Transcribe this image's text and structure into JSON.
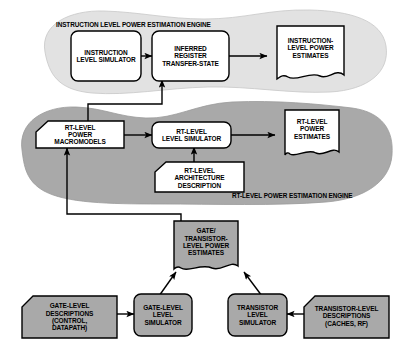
{
  "diagram": {
    "colors": {
      "instruction_blob": "#e2e2e2",
      "rt_blob": "#a9a9a9",
      "white_box": "#ffffff",
      "gray_box": "#a9a9a9",
      "stroke": "#000000",
      "background": "#ffffff"
    },
    "regions": [
      {
        "id": "instruction-engine",
        "label": "INSTRUCTION LEVEL POWER ESTIMATION ENGINE",
        "fill": "#e2e2e2"
      },
      {
        "id": "rt-engine",
        "label": "RT-LEVEL POWER ESTIMATION ENGINE",
        "fill": "#a9a9a9"
      }
    ],
    "nodes": [
      {
        "id": "instruction-level-simulator",
        "label": "INSTRUCTION\nLEVEL SIMULATOR",
        "shape": "rounded-rect",
        "fill": "#ffffff"
      },
      {
        "id": "inferred-register-transfer-state",
        "label": "INFERRED\nREGISTER\nTRANSFER-STATE",
        "shape": "rounded-rect",
        "fill": "#ffffff"
      },
      {
        "id": "instruction-level-power-estimates",
        "label": "INSTRUCTION-\nLEVEL POWER\nESTIMATES",
        "shape": "document",
        "fill": "#ffffff"
      },
      {
        "id": "rt-level-power-macromodels",
        "label": "RT-LEVEL\nPOWER\nMACROMODELS",
        "shape": "notched-rect",
        "fill": "#ffffff"
      },
      {
        "id": "rt-level-level-simulator",
        "label": "RT-LEVEL\nLEVEL SIMULATOR",
        "shape": "rounded-rect",
        "fill": "#ffffff"
      },
      {
        "id": "rt-level-power-estimates",
        "label": "RT-LEVEL\nPOWER\nESTIMATES",
        "shape": "document",
        "fill": "#ffffff"
      },
      {
        "id": "rt-level-architecture-description",
        "label": "RT-LEVEL\nARCHITECTURE\nDESCRIPTION",
        "shape": "notched-rect",
        "fill": "#ffffff"
      },
      {
        "id": "gate-transistor-level-power-estimates",
        "label": "GATE/\nTRANSISTOR-\nLEVEL POWER\nESTIMATES",
        "shape": "document",
        "fill": "#a9a9a9"
      },
      {
        "id": "gate-level-descriptions",
        "label": "GATE-LEVEL\nDESCRIPTIONS\n(CONTROL,\nDATAPATH)",
        "shape": "notched-rect",
        "fill": "#a9a9a9"
      },
      {
        "id": "gate-level-level-simulator",
        "label": "GATE-LEVEL\nLEVEL\nSIMULATOR",
        "shape": "rounded-rect",
        "fill": "#a9a9a9"
      },
      {
        "id": "transistor-level-simulator",
        "label": "TRANSISTOR\nLEVEL\nSIMULATOR",
        "shape": "rounded-rect",
        "fill": "#a9a9a9"
      },
      {
        "id": "transistor-level-descriptions",
        "label": "TRANSISTOR-LEVEL\nDESCRIPTIONS\n(CACHES, RF)",
        "shape": "notched-rect",
        "fill": "#a9a9a9"
      }
    ],
    "edges": [
      {
        "from": "instruction-level-simulator",
        "to": "inferred-register-transfer-state"
      },
      {
        "from": "inferred-register-transfer-state",
        "to": "instruction-level-power-estimates"
      },
      {
        "from": "rt-level-power-macromodels",
        "to": "rt-level-level-simulator"
      },
      {
        "from": "rt-level-level-simulator",
        "to": "rt-level-power-estimates"
      },
      {
        "from": "rt-level-architecture-description",
        "to": "rt-level-level-simulator"
      },
      {
        "from": "rt-level-power-macromodels",
        "to": "inferred-register-transfer-state"
      },
      {
        "from": "gate-transistor-level-power-estimates",
        "to": "rt-level-power-macromodels"
      },
      {
        "from": "gate-level-descriptions",
        "to": "gate-level-level-simulator"
      },
      {
        "from": "gate-level-level-simulator",
        "to": "gate-transistor-level-power-estimates"
      },
      {
        "from": "transistor-level-descriptions",
        "to": "transistor-level-simulator"
      },
      {
        "from": "transistor-level-simulator",
        "to": "gate-transistor-level-power-estimates"
      }
    ]
  }
}
